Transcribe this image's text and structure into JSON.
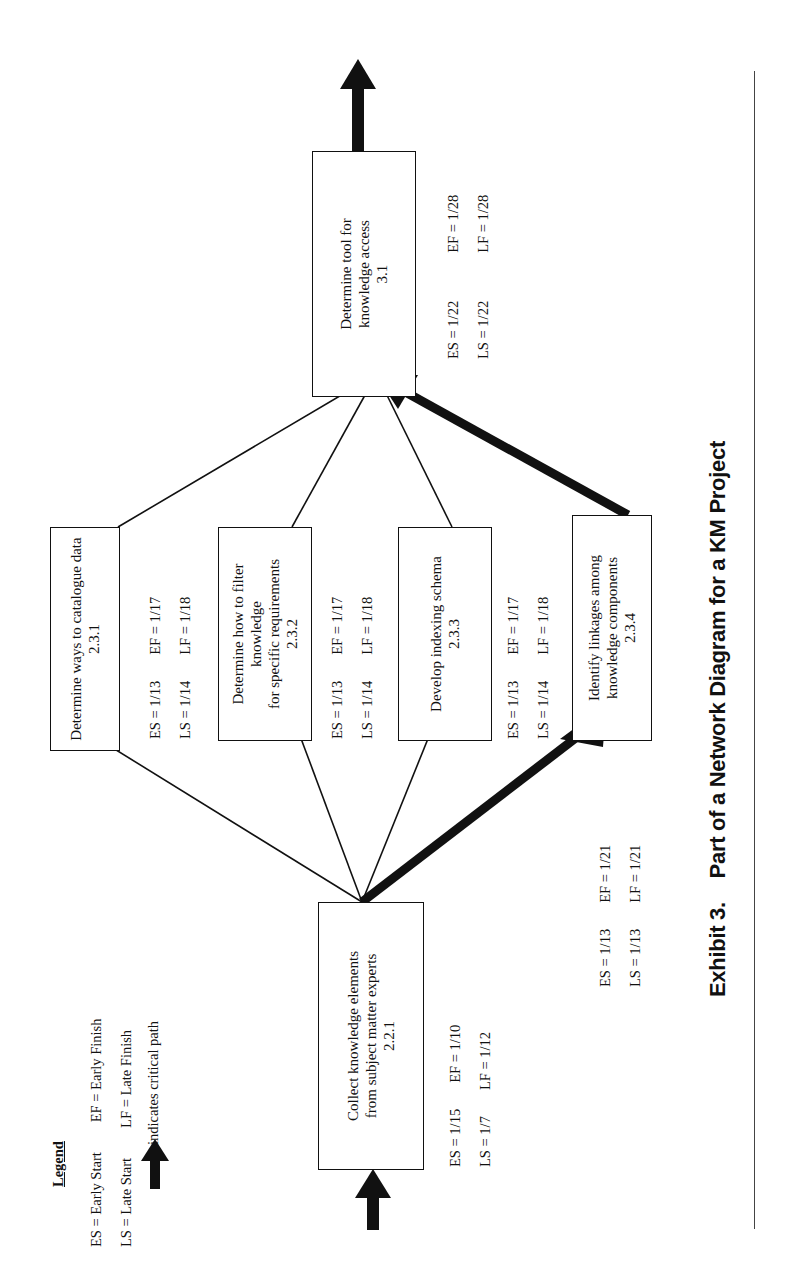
{
  "legend": {
    "title": "Legend",
    "items": [
      {
        "abbr_left": "ES = Early Start",
        "abbr_right": "EF = Early Finish"
      },
      {
        "abbr_left": "LS = Late Start",
        "abbr_right": "LF = Late Finish"
      }
    ],
    "critical_path_label": "indicates critical path",
    "critical_path_icon": "thick-arrow-icon"
  },
  "nodes": [
    {
      "id": "2.2.1",
      "label": "Collect knowledge elements\nfrom subject matter experts",
      "code": "2.2.1",
      "es": "ES = 1/15",
      "ef": "EF = 1/10",
      "ls": "LS = 1/7",
      "lf": "LF = 1/12"
    },
    {
      "id": "2.3.1",
      "label": "Determine ways to catalogue data",
      "code": "2.3.1",
      "es": "ES = 1/13",
      "ef": "EF = 1/17",
      "ls": "LS = 1/14",
      "lf": "LF = 1/18"
    },
    {
      "id": "2.3.2",
      "label": "Determine how to filter\nknowledge\nfor specific requirements",
      "code": "2.3.2",
      "es": "ES = 1/13",
      "ef": "EF = 1/17",
      "ls": "LS = 1/14",
      "lf": "LF = 1/18"
    },
    {
      "id": "2.3.3",
      "label": "Develop indexing schema",
      "code": "2.3.3",
      "es": "ES = 1/13",
      "ef": "EF = 1/17",
      "ls": "LS = 1/14",
      "lf": "LF = 1/18"
    },
    {
      "id": "2.3.4",
      "label": "Identify linkages among\nknowledge components",
      "code": "2.3.4",
      "es": "ES = 1/13",
      "ef": "EF = 1/21",
      "ls": "LS = 1/13",
      "lf": "LF = 1/21"
    },
    {
      "id": "3.1",
      "label": "Determine tool  for\nknowledge access",
      "code": "3.1",
      "es": "ES = 1/22",
      "ef": "EF = 1/28",
      "ls": "LS = 1/22",
      "lf": "LF = 1/28"
    }
  ],
  "edges": [
    {
      "from": "start",
      "to": "2.2.1",
      "critical": true
    },
    {
      "from": "2.2.1",
      "to": "2.3.1",
      "critical": false
    },
    {
      "from": "2.2.1",
      "to": "2.3.2",
      "critical": false
    },
    {
      "from": "2.2.1",
      "to": "2.3.3",
      "critical": false
    },
    {
      "from": "2.2.1",
      "to": "2.3.4",
      "critical": true
    },
    {
      "from": "2.3.1",
      "to": "3.1",
      "critical": false
    },
    {
      "from": "2.3.2",
      "to": "3.1",
      "critical": false
    },
    {
      "from": "2.3.3",
      "to": "3.1",
      "critical": false
    },
    {
      "from": "2.3.4",
      "to": "3.1",
      "critical": true
    },
    {
      "from": "3.1",
      "to": "end",
      "critical": true
    }
  ],
  "caption": {
    "number": "Exhibit 3.",
    "title": "Part of a Network Diagram for a KM Project"
  }
}
